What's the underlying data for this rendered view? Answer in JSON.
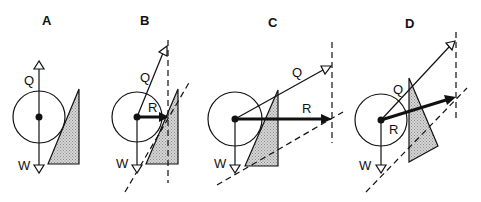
{
  "figure": {
    "colors": {
      "stroke": "#111111",
      "wedge_fill": "#c8c8c8",
      "background": "#ffffff"
    },
    "panels": [
      {
        "id": "A",
        "label": "A",
        "vectors": {
          "Q": "Q",
          "W": "W"
        }
      },
      {
        "id": "B",
        "label": "B",
        "vectors": {
          "Q": "Q",
          "R": "R",
          "W": "W"
        }
      },
      {
        "id": "C",
        "label": "C",
        "vectors": {
          "Q": "Q",
          "R": "R",
          "W": "W"
        }
      },
      {
        "id": "D",
        "label": "D",
        "vectors": {
          "Q": "Q",
          "R": "R",
          "W": "W"
        }
      }
    ]
  }
}
